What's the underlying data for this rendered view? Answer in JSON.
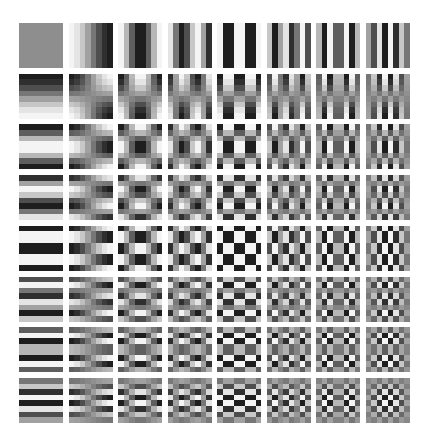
{
  "figure": {
    "title": "8x8 DCT basis functions",
    "grid_rows": 8,
    "grid_cols": 8,
    "block_size": 8,
    "layout": {
      "origin_x": 19,
      "origin_y": 23,
      "col_pitch": 49.5,
      "row_pitch": 50.7,
      "tile_width": 44,
      "tile_height": 45
    },
    "colors": {
      "background": "#ffffff",
      "zero_level": "#8c8c8c",
      "positive": "#1e1e1e",
      "negative": "#f4f4f4",
      "dc_tile": "#8e8e8e"
    },
    "sign_convention": {
      "row_0_horizontal_sign": -1,
      "default_sign": 1
    },
    "tiles_description": "Row index = vertical frequency v (0-7), column index = horizontal frequency u (0-7); tile (0,0) is the uniform DC gray block"
  }
}
